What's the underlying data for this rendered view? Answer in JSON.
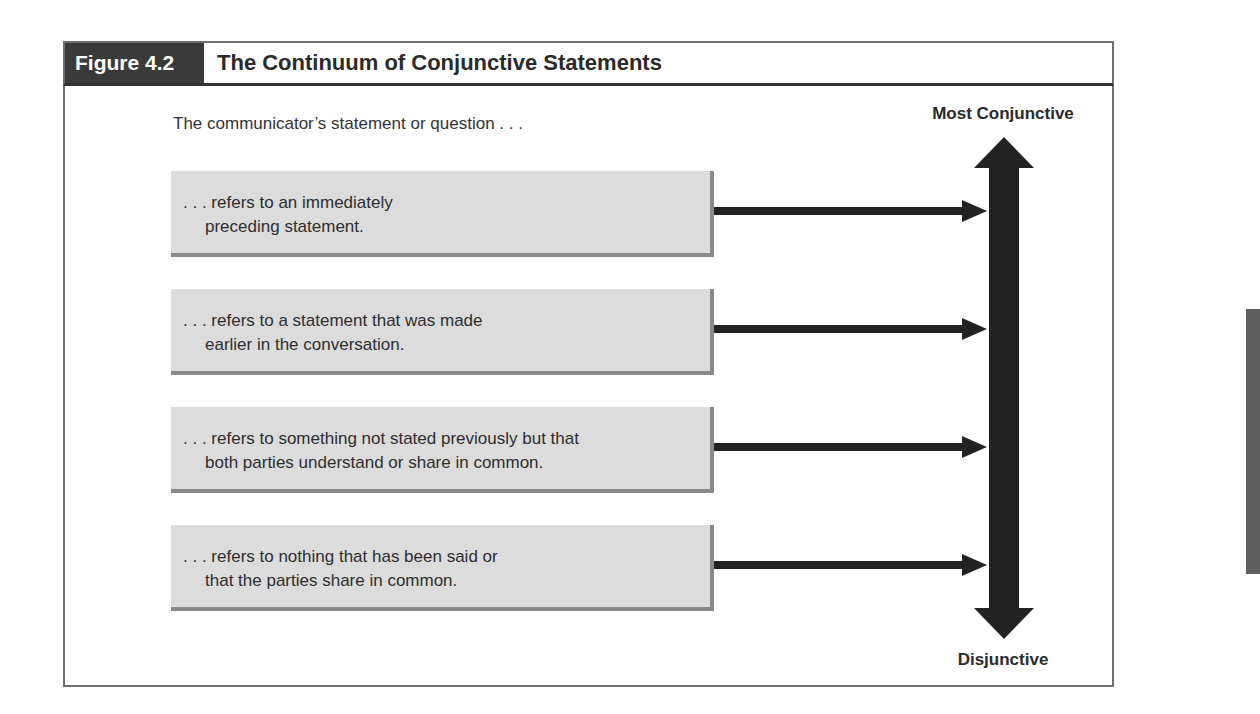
{
  "figure": {
    "label": "Figure 4.2",
    "title": "The Continuum of Conjunctive Statements",
    "intro": "The communicator’s statement or question . . .",
    "scale": {
      "top_label": "Most Conjunctive",
      "bottom_label": "Disjunctive"
    },
    "items": [
      {
        "line1": ". . . refers to an immediately",
        "line2": "preceding statement."
      },
      {
        "line1": ". . . refers to a statement that was made",
        "line2": "earlier in the conversation."
      },
      {
        "line1": ". . . refers to something not stated previously but that",
        "line2": "both parties understand or share in common."
      },
      {
        "line1": ". . . refers to nothing that has been said or",
        "line2": "that the parties share in common."
      }
    ]
  },
  "colors": {
    "header_label_bg": "#3a3a3a",
    "box_bg": "#dcdcdc",
    "box_shadow": "#8a8a8a",
    "arrow": "#222222",
    "frame": "#6e6e6e"
  }
}
